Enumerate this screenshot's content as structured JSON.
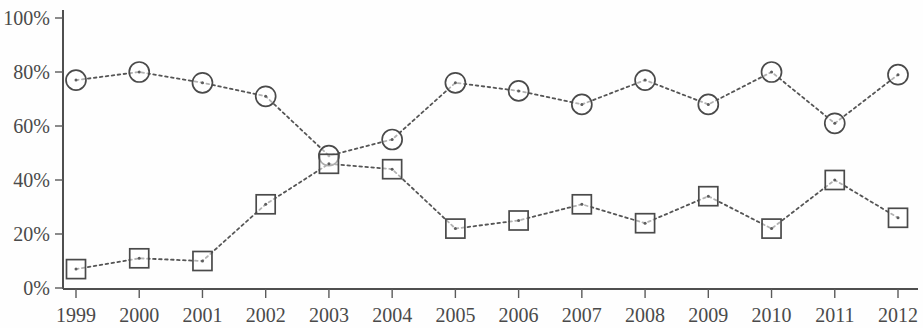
{
  "chart_data": {
    "type": "line",
    "title": "",
    "subtitle": "",
    "xlabel": "",
    "ylabel": "",
    "categories": [
      "1999",
      "2000",
      "2001",
      "2002",
      "2003",
      "2004",
      "2005",
      "2006",
      "2007",
      "2008",
      "2009",
      "2010",
      "2011",
      "2012"
    ],
    "x": [
      1999,
      2000,
      2001,
      2002,
      2003,
      2004,
      2005,
      2006,
      2007,
      2008,
      2009,
      2010,
      2011,
      2012
    ],
    "ylim": [
      0,
      100
    ],
    "xlim": [
      1999,
      2012
    ],
    "y_tick_labels": [
      "0%",
      "20%",
      "40%",
      "60%",
      "80%",
      "100%"
    ],
    "y_tick_values": [
      0,
      20,
      40,
      60,
      80,
      100
    ],
    "x_tick_labels": [
      "1999",
      "2000",
      "2001",
      "2002",
      "2003",
      "2004",
      "2005",
      "2006",
      "2007",
      "2008",
      "2009",
      "2010",
      "2011",
      "2012"
    ],
    "grid": false,
    "legend": false,
    "legend_position": "none",
    "line_style": "dotted",
    "series": [
      {
        "name": "series-circle",
        "marker": "circle",
        "color": "#4a4a4a",
        "values": [
          77,
          80,
          76,
          71,
          49,
          55,
          76,
          73,
          68,
          77,
          68,
          80,
          61,
          79
        ]
      },
      {
        "name": "series-square",
        "marker": "square",
        "color": "#4a4a4a",
        "values": [
          7,
          11,
          10,
          31,
          46,
          44,
          22,
          25,
          31,
          24,
          34,
          22,
          40,
          26
        ]
      }
    ]
  },
  "axes": {
    "y_axis_name": "percentage-axis",
    "x_axis_name": "year-axis"
  }
}
